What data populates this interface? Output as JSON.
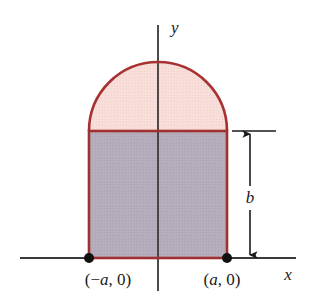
{
  "figure": {
    "background_color": "#ffffff",
    "axes": {
      "x_axis_label": "x",
      "y_axis_label": "y",
      "axis_color": "#3a3a3a",
      "x_axis_y_px": 258,
      "x_axis_start_px": 20,
      "x_axis_end_px": 296,
      "y_axis_x_px": 158,
      "y_axis_top_px": 25,
      "y_axis_bottom_px": 291
    },
    "shapes": {
      "rectangle": {
        "name": "rectangle-region",
        "fill_color": "#b5acbb",
        "stroke_color": "#a03030",
        "left_px": 89,
        "right_px": 227,
        "top_px": 131,
        "bottom_px": 258,
        "width_description": "2a",
        "height_description": "b"
      },
      "semicircle": {
        "name": "semicircle-region",
        "fill_color": "#f7dcd8",
        "stroke_color": "#a83232",
        "center_x_px": 158,
        "center_y_px": 131,
        "radius_px": 69,
        "radius_description": "a"
      }
    },
    "points": [
      {
        "name": "point-left",
        "label": "(−a, 0)",
        "label_prefix": "(−",
        "label_variable": "a",
        "label_suffix": ", 0)",
        "x_px": 89,
        "y_px": 258,
        "marker_color": "#111111",
        "marker_radius_px": 5
      },
      {
        "name": "point-right",
        "label": "(a, 0)",
        "label_prefix": "(",
        "label_variable": "a",
        "label_suffix": ", 0)",
        "x_px": 227,
        "y_px": 258,
        "marker_color": "#111111",
        "marker_radius_px": 5
      }
    ],
    "dimension": {
      "name": "height-dimension-b",
      "label": "b",
      "line_color": "#1a1a1a",
      "arrow_x_px": 250,
      "top_y_px": 131,
      "bottom_y_px": 258,
      "tick_left_px": 232,
      "tick_right_px": 276,
      "label_x_px": 250,
      "label_y_px": 201
    }
  }
}
